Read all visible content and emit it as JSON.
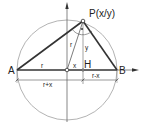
{
  "diagram": {
    "points": {
      "A": {
        "label": "A"
      },
      "B": {
        "label": "B"
      },
      "H": {
        "label": "H"
      },
      "P": {
        "label": "P(x/y)"
      }
    },
    "segment_labels": {
      "radius_AO": "r",
      "radius_OP": "r",
      "x_offset": "x",
      "height_PH": "y",
      "dim_AH": "r+x",
      "dim_HB": "r-x"
    },
    "colors": {
      "line": "#333333",
      "circle": "#9a9a9a",
      "background": "#ffffff"
    }
  }
}
